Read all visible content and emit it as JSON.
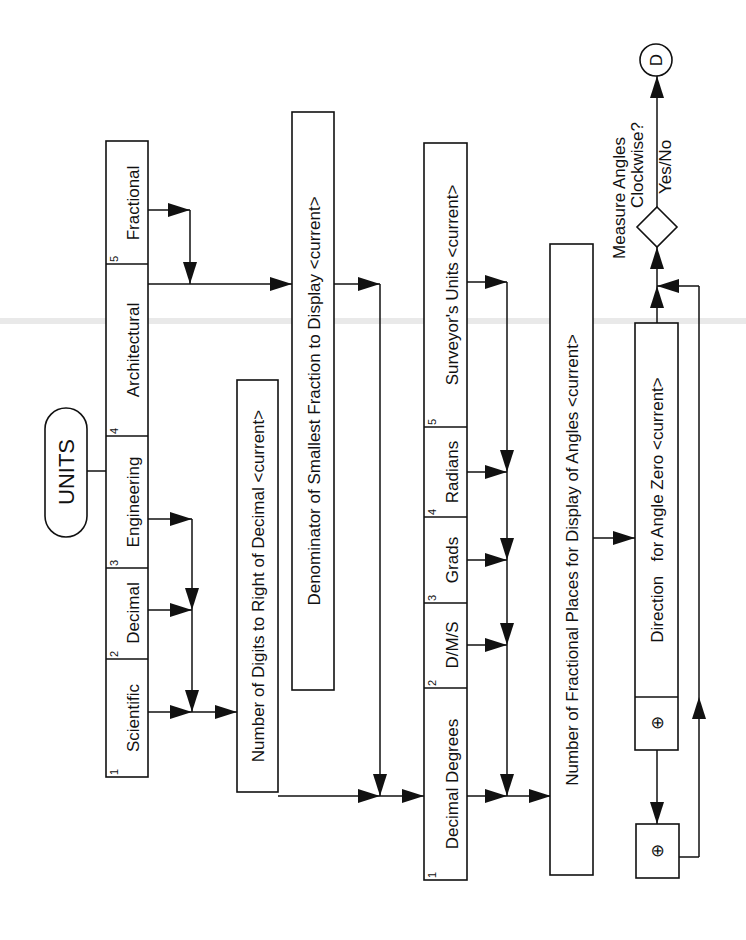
{
  "diagram": {
    "title": "UNITS",
    "orientation": "rotated -90deg (read bottom-to-top)",
    "colors": {
      "ink": "#111111",
      "paper": "#ffffff"
    },
    "units_options": [
      {
        "num": "1",
        "label": "Scientific"
      },
      {
        "num": "2",
        "label": "Decimal"
      },
      {
        "num": "3",
        "label": "Engineering"
      },
      {
        "num": "4",
        "label": "Architectural"
      },
      {
        "num": "5",
        "label": "Fractional"
      }
    ],
    "digits_prompt": "Number of Digits to Right of Decimal <current>",
    "denominator_prompt": "Denominator of Smallest Fraction to Display <current>",
    "angle_options": [
      {
        "num": "1",
        "label": "Decimal Degrees"
      },
      {
        "num": "2",
        "label": "D/M/S"
      },
      {
        "num": "3",
        "label": "Grads"
      },
      {
        "num": "4",
        "label": "Radians"
      },
      {
        "num": "5",
        "label": "Surveyor's Units <current>"
      }
    ],
    "fractional_places_prompt": "Number of Fractional Places for Display of Angles <current>",
    "direction": {
      "pick_symbol": "⊕",
      "label": "Direction   for Angle Zero <current>"
    },
    "pick_box_symbol": "⊕",
    "decision": {
      "line1": "Measure Angles",
      "line2": "Clockwise?",
      "answer": "Yes/No"
    },
    "connector": "D"
  }
}
